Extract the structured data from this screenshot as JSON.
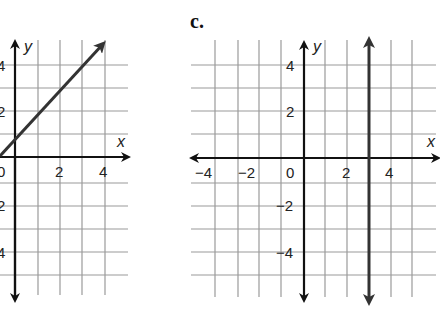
{
  "panels": [
    {
      "id": "b",
      "label": "",
      "x_axis_label": "x",
      "y_axis_label": "y",
      "x_ticks": [
        "0",
        "2",
        "4"
      ],
      "y_ticks": [
        "4",
        "2",
        "2",
        "4"
      ],
      "graph": {
        "type": "line",
        "slope": 1,
        "y_intercept": 1,
        "description": "y = x + 1"
      }
    },
    {
      "id": "c",
      "label": "c.",
      "x_axis_label": "x",
      "y_axis_label": "y",
      "x_ticks": [
        "−4",
        "−2",
        "0",
        "2",
        "4"
      ],
      "y_ticks": [
        "4",
        "2",
        "−2",
        "−4"
      ],
      "graph": {
        "type": "vertical_line",
        "x": 3,
        "description": "x = 3"
      }
    }
  ]
}
